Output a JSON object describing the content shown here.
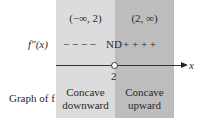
{
  "intervals": [
    {
      "label": "(−∞, 2)",
      "sign": "− − − −",
      "description_line1": "Concave",
      "description_line2": "downward",
      "shade": "#dcdcdc"
    },
    {
      "label": "(2, ∞)",
      "sign": "+ + + +",
      "description_line1": "Concave",
      "description_line2": "upward",
      "shade": "#bdbdbd"
    }
  ],
  "row_labels": {
    "second_derivative": "f″(x)",
    "graph": "Graph of f"
  },
  "critical_value": {
    "x": "2",
    "marker": "ND"
  },
  "axis_label": "x"
}
